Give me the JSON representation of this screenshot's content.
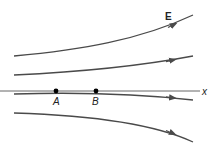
{
  "diagram": {
    "field_label": "E",
    "axis_label": "x",
    "points": [
      {
        "label": "A",
        "cx": 56,
        "cy": 91
      },
      {
        "label": "B",
        "cx": 96,
        "cy": 91
      }
    ],
    "colors": {
      "field_line": "#4a4a4a",
      "axis": "#555555",
      "point": "#000000"
    }
  }
}
